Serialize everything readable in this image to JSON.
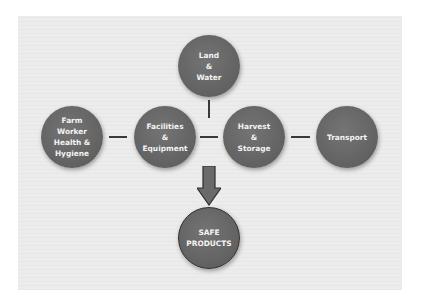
{
  "diagram": {
    "nodes": [
      {
        "id": "land-water",
        "label": "Land\n&\nWater"
      },
      {
        "id": "farm-worker",
        "label": "Farm\nWorker\nHealth &\nHygiene"
      },
      {
        "id": "facilities",
        "label": "Facilities\n&\nEquipment"
      },
      {
        "id": "harvest",
        "label": "Harvest\n&\nStorage"
      },
      {
        "id": "transport",
        "label": "Transport"
      },
      {
        "id": "safe-products",
        "label": "SAFE\nPRODUCTS"
      }
    ],
    "edges": [
      {
        "from": "land-water",
        "to": "center-junction"
      },
      {
        "from": "farm-worker",
        "to": "facilities"
      },
      {
        "from": "facilities",
        "to": "harvest"
      },
      {
        "from": "harvest",
        "to": "transport"
      },
      {
        "from": "center-junction",
        "to": "safe-products",
        "style": "arrow"
      }
    ],
    "colors": {
      "node_fill": "#666666",
      "node_text": "#f4f4f4",
      "panel_bg": "#ececec",
      "arrow_fill": "#6a6a6a"
    }
  }
}
